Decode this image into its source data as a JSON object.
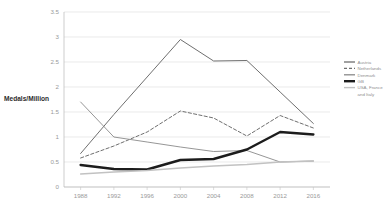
{
  "chart_data": {
    "type": "line",
    "title": "",
    "xlabel": "",
    "ylabel": "Medals/Million",
    "categories": [
      "1988",
      "1992",
      "1996",
      "2000",
      "2004",
      "2008",
      "2012",
      "2016"
    ],
    "ylim": [
      0,
      3.5
    ],
    "yticks": [
      "0",
      "0.5",
      "1",
      "1.5",
      "2",
      "2.5",
      "3",
      "3.5"
    ],
    "ytick_values": [
      0,
      0.5,
      1,
      1.5,
      2,
      2.5,
      3,
      3.5
    ],
    "grid": true,
    "legend_position": "right",
    "series": [
      {
        "name": "Austria",
        "values": [
          0.67,
          1.45,
          2.2,
          2.95,
          2.52,
          2.53,
          1.9,
          1.27
        ],
        "color": "#6f6f6f",
        "style": "solid",
        "width": 1.0
      },
      {
        "name": "Netherlands",
        "values": [
          0.58,
          0.82,
          1.1,
          1.52,
          1.38,
          1.02,
          1.43,
          1.18
        ],
        "color": "#6f6f6f",
        "style": "dashed",
        "width": 1.0
      },
      {
        "name": "Denmark",
        "values": [
          1.7,
          1.0,
          0.9,
          0.8,
          0.71,
          0.73,
          0.5,
          0.52
        ],
        "color": "#8a8a8a",
        "style": "solid",
        "width": 0.9
      },
      {
        "name": "GB",
        "values": [
          0.44,
          0.36,
          0.35,
          0.54,
          0.56,
          0.75,
          1.1,
          1.05
        ],
        "color": "#1c1c1c",
        "style": "solid",
        "width": 2.4
      },
      {
        "name": "USA, France and Italy",
        "values": [
          0.26,
          0.3,
          0.33,
          0.38,
          0.42,
          0.45,
          0.5,
          0.52
        ],
        "color": "#c2c2c2",
        "style": "solid",
        "width": 1.4
      }
    ]
  },
  "legend": {
    "items": [
      {
        "label": "Austria"
      },
      {
        "label": "Netherlands"
      },
      {
        "label": "Denmark"
      },
      {
        "label": "GB"
      },
      {
        "label": "USA, France"
      },
      {
        "label": "and Italy"
      }
    ]
  }
}
